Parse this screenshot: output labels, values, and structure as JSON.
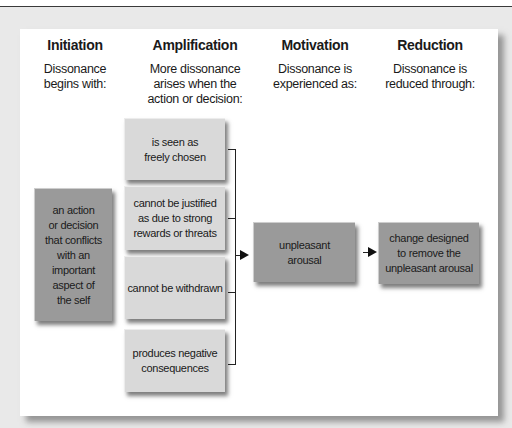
{
  "diagram": {
    "columns": [
      {
        "title": "Initiation",
        "subtitle_lines": [
          "Dissonance",
          "begins with:"
        ]
      },
      {
        "title": "Amplification",
        "subtitle_lines": [
          "More dissonance",
          "arises when the",
          "action or decision:"
        ]
      },
      {
        "title": "Motivation",
        "subtitle_lines": [
          "Dissonance is",
          "experienced as:"
        ]
      },
      {
        "title": "Reduction",
        "subtitle_lines": [
          "Dissonance is",
          "reduced through:"
        ]
      }
    ],
    "initiation_box": {
      "lines": [
        "an action",
        "or decision",
        "that conflicts",
        "with an",
        "important",
        "aspect of",
        "the self"
      ]
    },
    "amplification_boxes": [
      {
        "lines": [
          "is seen as",
          "freely chosen"
        ]
      },
      {
        "lines": [
          "cannot be justified",
          "as due to strong",
          "rewards or threats"
        ]
      },
      {
        "lines": [
          "cannot be withdrawn"
        ]
      },
      {
        "lines": [
          "produces negative",
          "consequences"
        ]
      }
    ],
    "motivation_box": {
      "lines": [
        "unpleasant",
        "arousal"
      ]
    },
    "reduction_box": {
      "lines": [
        "change designed",
        "to remove the",
        "unpleasant arousal"
      ]
    },
    "colors": {
      "light_box": "#d9d9d9",
      "dark_box": "#9a9a9a",
      "background": "#e9e9e9",
      "panel": "#ffffff"
    }
  }
}
